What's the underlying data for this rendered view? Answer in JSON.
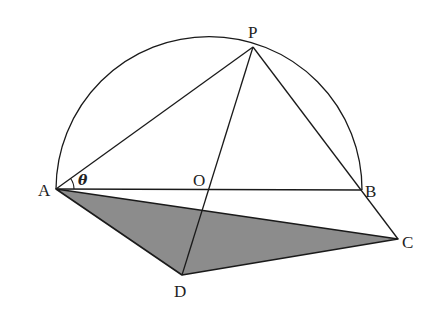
{
  "diagram": {
    "type": "geometry",
    "colors": {
      "stroke": "#1a1a1a",
      "shade": "#8c8c8c",
      "background": "#ffffff"
    },
    "points": {
      "A": {
        "label": "A",
        "x": 56,
        "y": 189
      },
      "B": {
        "label": "B",
        "x": 362,
        "y": 190
      },
      "O": {
        "label": "O",
        "x": 209,
        "y": 189
      },
      "P": {
        "label": "P",
        "x": 253,
        "y": 47
      },
      "C": {
        "label": "C",
        "x": 398,
        "y": 239
      },
      "D": {
        "label": "D",
        "x": 182,
        "y": 275
      }
    },
    "angle_label": "θ",
    "segments": [
      [
        "A",
        "B"
      ],
      [
        "A",
        "P"
      ],
      [
        "P",
        "B"
      ],
      [
        "B",
        "C"
      ],
      [
        "P",
        "D"
      ],
      [
        "A",
        "C"
      ],
      [
        "A",
        "D"
      ],
      [
        "D",
        "C"
      ]
    ],
    "shaded_region": [
      "A",
      "C",
      "D"
    ],
    "arc": {
      "center": "O",
      "radius": 153,
      "from": "A",
      "to": "B",
      "side": "upper"
    }
  }
}
